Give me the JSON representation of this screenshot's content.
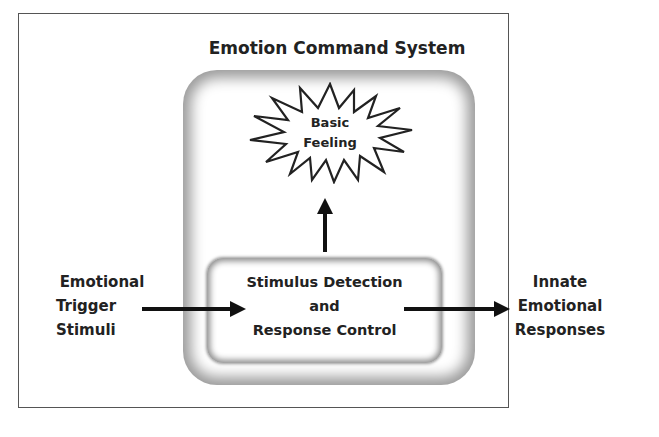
{
  "diagram": {
    "title": "Emotion Command System",
    "burst": {
      "line1": "Basic",
      "line2": "Feeling"
    },
    "core": {
      "line1": "Stimulus Detection",
      "line2": "and",
      "line3": "Response Control"
    },
    "input": {
      "line1": "Emotional",
      "line2": "Trigger",
      "line3": "Stimuli"
    },
    "output": {
      "line1": "Innate",
      "line2": "Emotional",
      "line3": "Responses"
    },
    "colors": {
      "text": "#222222",
      "frame": "#555555",
      "glow": "#9a9a9a",
      "arrow": "#111111"
    }
  }
}
